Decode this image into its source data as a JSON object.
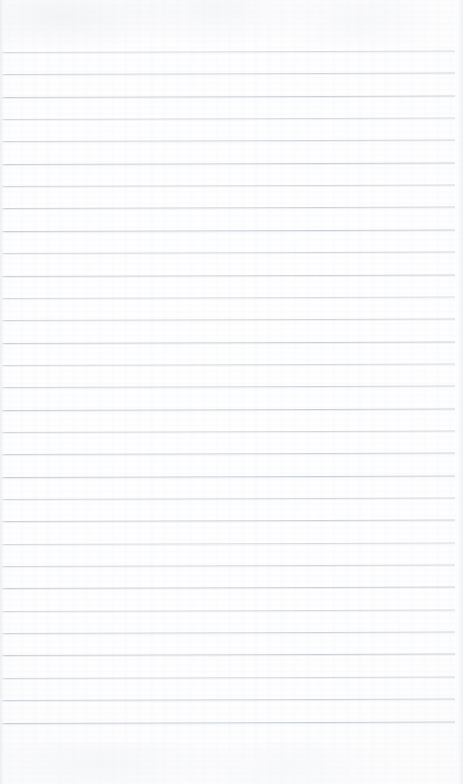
{
  "document": {
    "type": "scanned-page",
    "title": "Blank ruled notepad page",
    "content_text": "",
    "handwriting_present": "no",
    "printed_text_present": "no",
    "page_width_px": 463,
    "page_height_px": 784
  },
  "paper": {
    "background_color": "#ffffff",
    "edge_shade_color": "#eaecef",
    "grain_color": "#f5f6f8",
    "top_margin_px": 52,
    "bottom_margin_px": 49,
    "left_margin_px": 2,
    "right_margin_px": 8
  },
  "ruling": {
    "style": "horizontal-ruled",
    "line_color": "#c9ced4",
    "line_thickness_px": 1,
    "line_spacing_px": 22.35,
    "first_line_y_px": 52,
    "line_count": 31,
    "line_start_x_px": 2,
    "line_end_x_px": 455,
    "skew_degrees": -0.18,
    "margin_rule_present": "no"
  },
  "annotations": {
    "none_label": ""
  }
}
